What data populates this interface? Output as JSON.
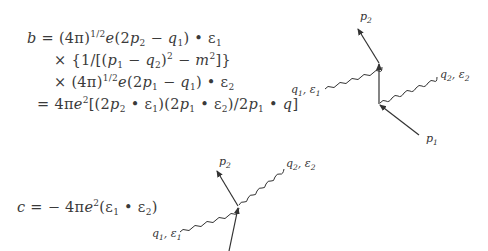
{
  "equation_b": {
    "line1": {
      "lhs": "b",
      "eq": "=",
      "text": "(4π)",
      "exp": "1/2",
      "rest_e": "e",
      "rest": "(2",
      "p": "p",
      "p_sub": "2",
      "minus": " − ",
      "q": "q",
      "q_sub": "1",
      "tail": ") • ε",
      "tail_sub": "1"
    },
    "line2": {
      "op": "×",
      "text": "{1/[(",
      "p": "p",
      "p_sub": "1",
      "minus": " − ",
      "q": "q",
      "q_sub": "2",
      "close": ")",
      "exp": "2",
      "minus2": " − ",
      "m": "m",
      "m_exp": "2",
      "end": "]}"
    },
    "line3": {
      "op": "×",
      "text": "(4π)",
      "exp": "1/2",
      "rest_e": "e",
      "rest": "(2",
      "p": "p",
      "p_sub": "1",
      "minus": " − ",
      "q": "q",
      "q_sub": "1",
      "tail": ") • ε",
      "tail_sub": "2"
    },
    "line4": {
      "op": "=",
      "text": "4π",
      "e": "e",
      "e_exp": "2",
      "a": "[(2",
      "p2": "p",
      "p2_sub": "2",
      "b": " • ε",
      "b_sub": "1",
      "c": ")(2",
      "p1": "p",
      "p1_sub": "1",
      "d": " • ε",
      "d_sub": "2",
      "e2": ")/2",
      "p1b": "p",
      "p1b_sub": "1",
      "f": " • ",
      "q": "q",
      "g": "]"
    }
  },
  "equation_c": {
    "lhs": "c",
    "eq": "=",
    "minus": "− 4π",
    "e": "e",
    "e_exp": "2",
    "a": "(ε",
    "a_sub": "1",
    "b": " • ε",
    "b_sub": "2",
    "c": ")"
  },
  "diagram_top": {
    "labels": {
      "p2": {
        "main": "p",
        "sub": "2"
      },
      "p1": {
        "main": "p",
        "sub": "1"
      },
      "q1": {
        "main": "q",
        "sub": "1",
        "sep": ", ",
        "eps": "ε",
        "eps_sub": "1"
      },
      "q2": {
        "main": "q",
        "sub": "2",
        "sep": ", ",
        "eps": "ε",
        "eps_sub": "2"
      }
    }
  },
  "diagram_bottom": {
    "labels": {
      "p2": {
        "main": "p",
        "sub": "2"
      },
      "q1": {
        "main": "q",
        "sub": "1",
        "sep": ", ",
        "eps": "ε",
        "eps_sub": "1"
      },
      "q2": {
        "main": "q",
        "sub": "2",
        "sep": ", ",
        "eps": "ε",
        "eps_sub": "2"
      }
    }
  },
  "colors": {
    "text": "#3a3a3a",
    "lines": "#333333",
    "background": "#ffffff"
  }
}
